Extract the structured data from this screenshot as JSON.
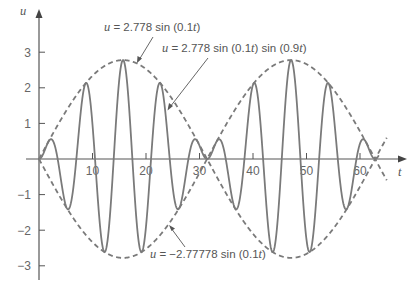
{
  "chart_data": {
    "type": "line",
    "title": "",
    "xlabel": "t",
    "ylabel": "u",
    "xlim": [
      0,
      68
    ],
    "ylim": [
      -3.4,
      4.2
    ],
    "grid": false,
    "x_ticks": [
      10,
      20,
      30,
      40,
      50,
      60
    ],
    "y_ticks": [
      -3,
      -2,
      -1,
      1,
      2,
      3
    ],
    "series": [
      {
        "name": "u = 2.778 sin (0.1t) sin (0.9t)",
        "style": "solid",
        "formula": "2.778*sin(0.1t)*sin(0.9t)",
        "t_range": [
          0,
          63.5
        ]
      },
      {
        "name": "u = 2.778 sin (0.1t)",
        "style": "dashed",
        "formula": "2.778*sin(0.1t)",
        "t_range": [
          0,
          65
        ]
      },
      {
        "name": "u = -2.77778 sin (0.1t)",
        "style": "dashed",
        "formula": "-2.77778*sin(0.1t)",
        "t_range": [
          0,
          65
        ]
      }
    ],
    "annotations": [
      {
        "text_pre": "u",
        "text": " = 2.778 sin (0.1",
        "text_t": "t",
        "text_post": ")",
        "target": "upper envelope"
      },
      {
        "text_pre": "u",
        "text": " = 2.778 sin (0.1",
        "text_t": "t",
        "text_mid": ") sin (0.9",
        "text_t2": "t",
        "text_post": ")",
        "target": "solid curve"
      },
      {
        "text_pre": "u",
        "text": " = −2.77778 sin (0.1",
        "text_t": "t",
        "text_post": ")",
        "target": "lower envelope"
      }
    ]
  },
  "axes": {
    "x_label": "t",
    "y_label": "u",
    "x_tick_labels": [
      "10",
      "20",
      "30",
      "40",
      "50",
      "60"
    ],
    "y_tick_labels": [
      "3",
      "2",
      "1",
      "−1",
      "−2",
      "−3"
    ]
  },
  "colors": {
    "curve": "#7a7a7a",
    "axis": "#555555"
  }
}
